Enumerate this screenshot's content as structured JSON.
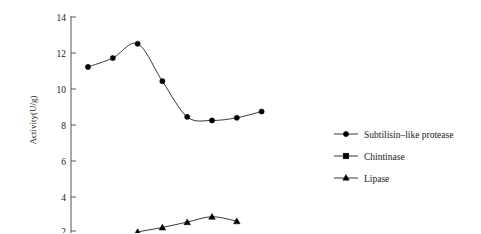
{
  "chart_data": {
    "type": "line",
    "title": "",
    "xlabel": "",
    "ylabel": "Activity(U/g)",
    "ylim": [
      1.6,
      14.4
    ],
    "yticks": [
      2,
      4,
      6,
      8,
      10,
      12,
      14
    ],
    "ytick_labels": [
      "2",
      "4",
      "6",
      "8",
      "10",
      "12",
      "14"
    ],
    "grid": false,
    "legend_position": "right",
    "x": [
      1,
      2,
      3,
      4,
      5,
      6,
      7,
      8
    ],
    "series": [
      {
        "name": "Subtilisin–like protease",
        "marker": "circle",
        "values": [
          11.2,
          11.7,
          12.5,
          10.4,
          8.4,
          8.2,
          8.35,
          8.7
        ]
      },
      {
        "name": "Chintinase",
        "marker": "square",
        "values": [
          null,
          null,
          null,
          null,
          null,
          null,
          null,
          null
        ]
      },
      {
        "name": "Lipase",
        "marker": "triangle",
        "values": [
          null,
          null,
          1.95,
          2.2,
          2.5,
          2.8,
          2.55,
          null
        ]
      }
    ]
  },
  "axis": {
    "y_title": "Activity(U/g)"
  },
  "legend": {
    "entries": [
      {
        "label": "Subtilisin–like protease",
        "marker": "circle"
      },
      {
        "label": "Chintinase",
        "marker": "square"
      },
      {
        "label": "Lipase",
        "marker": "triangle"
      }
    ]
  },
  "colors": {
    "line": "#222222",
    "marker": "#000000",
    "axis": "#555555",
    "text": "#1a1a1a",
    "background": "#ffffff"
  }
}
